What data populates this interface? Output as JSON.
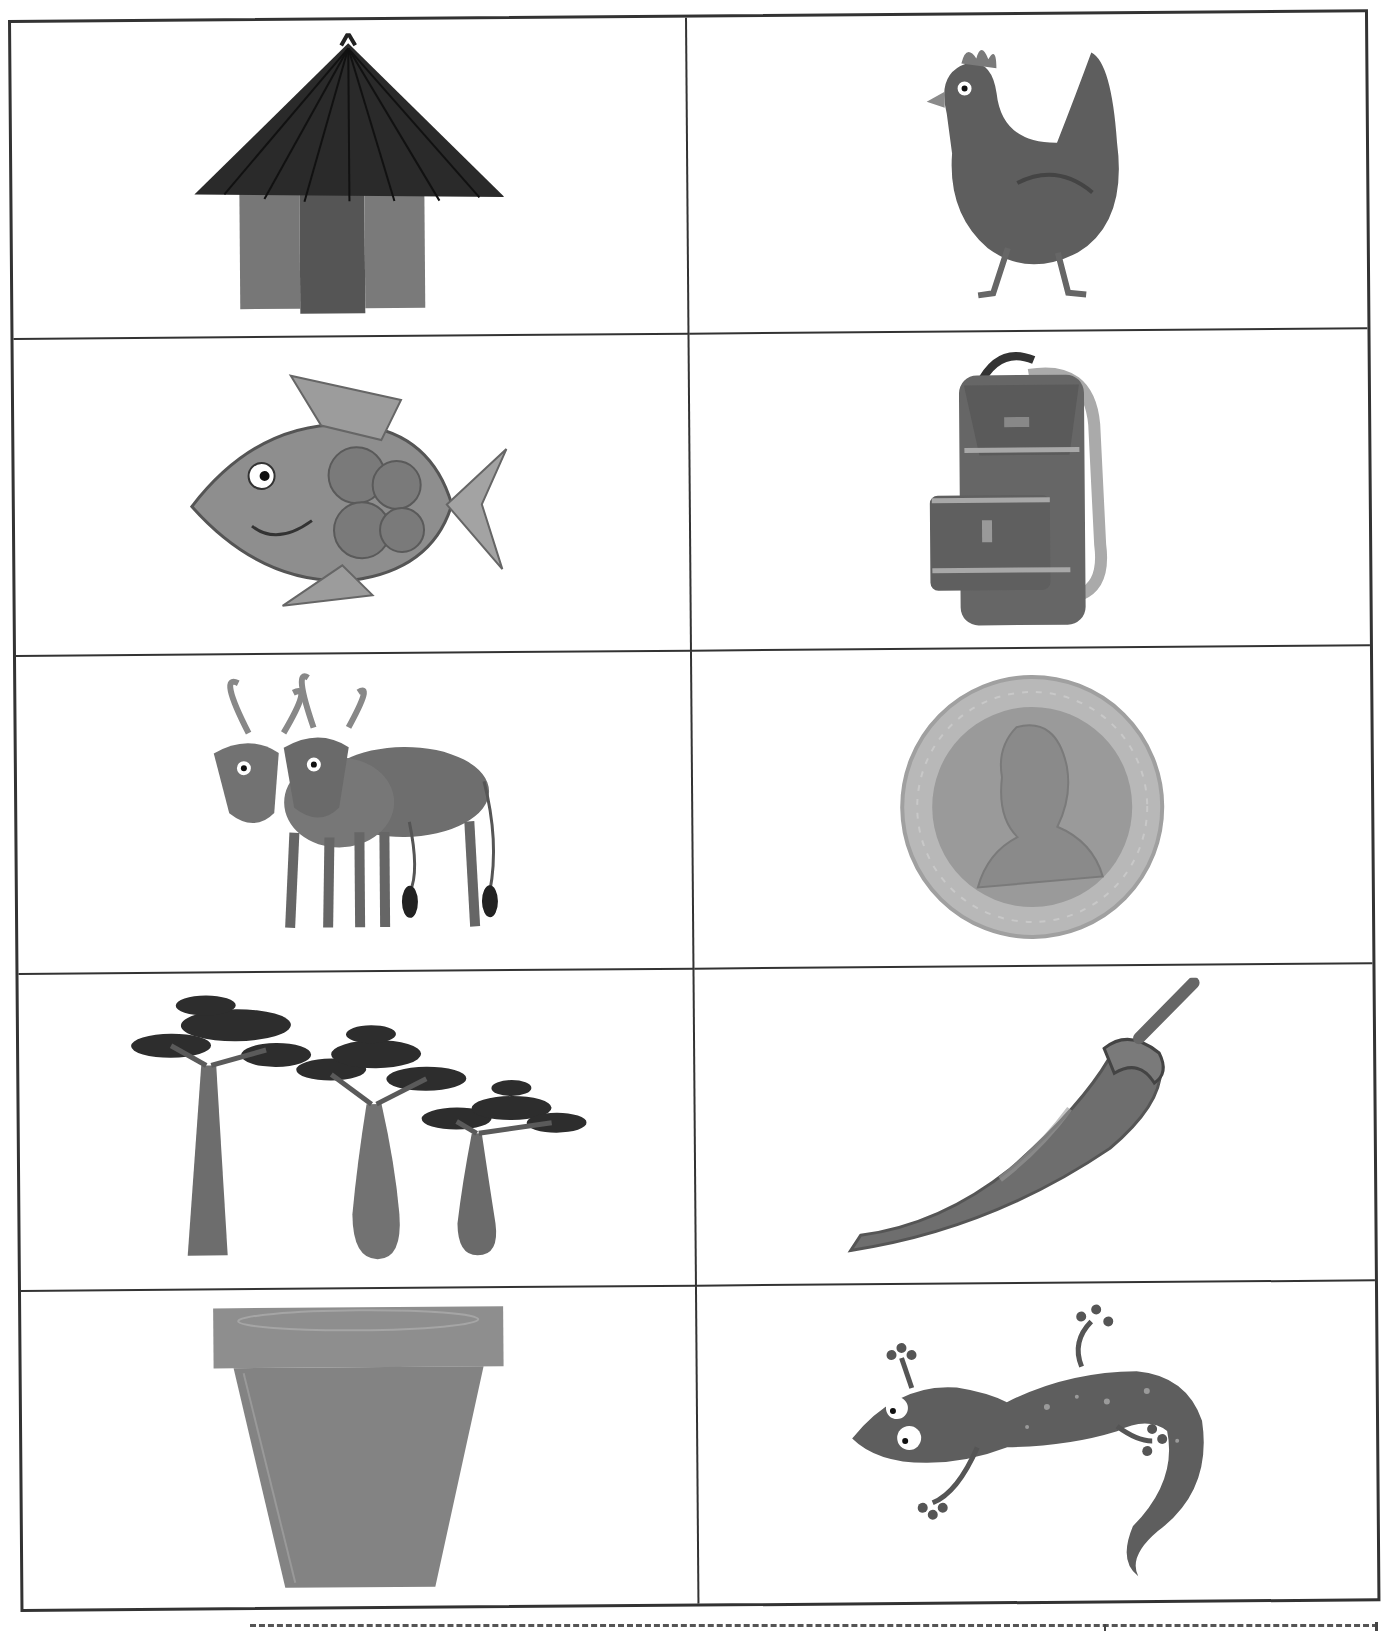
{
  "worksheet": {
    "layout": {
      "columns": 2,
      "rows": 5
    },
    "cells": [
      {
        "row": 1,
        "col": 1,
        "picture": "thatched round hut",
        "icon": "hut-icon"
      },
      {
        "row": 1,
        "col": 2,
        "picture": "hen walking",
        "icon": "hen-icon"
      },
      {
        "row": 2,
        "col": 1,
        "picture": "fish",
        "icon": "fish-icon"
      },
      {
        "row": 2,
        "col": 2,
        "picture": "backpack",
        "icon": "backpack-icon"
      },
      {
        "row": 3,
        "col": 1,
        "picture": "two cattle with long horns",
        "icon": "cattle-icon"
      },
      {
        "row": 3,
        "col": 2,
        "picture": "coin with portrait",
        "icon": "coin-icon"
      },
      {
        "row": 4,
        "col": 1,
        "picture": "baobab trees",
        "icon": "baobab-trees-icon"
      },
      {
        "row": 4,
        "col": 2,
        "picture": "chili pepper",
        "icon": "chili-pepper-icon"
      },
      {
        "row": 5,
        "col": 1,
        "picture": "clay flower pot",
        "icon": "pot-icon"
      },
      {
        "row": 5,
        "col": 2,
        "picture": "lizard",
        "icon": "lizard-icon"
      }
    ],
    "cut_line": {
      "style": "dashed",
      "position": "bottom"
    }
  },
  "colors": {
    "border": "#333333",
    "dark_fill": "#2e2e2e",
    "mid_fill": "#6a6a6a",
    "light_fill": "#9a9a9a",
    "pale_fill": "#bdbdbd",
    "background": "#ffffff"
  }
}
